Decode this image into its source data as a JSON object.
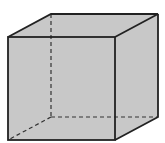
{
  "diagram": {
    "type": "cube-wireframe",
    "colors": {
      "fill": "#c8c8c8",
      "stroke": "#222222",
      "background": "#ffffff"
    },
    "vertices": {
      "front_top_left": [
        8,
        37
      ],
      "front_top_right": [
        115,
        37
      ],
      "front_bottom_left": [
        8,
        140
      ],
      "front_bottom_right": [
        115,
        140
      ],
      "back_top_left": [
        51,
        14
      ],
      "back_top_right": [
        158,
        14
      ],
      "back_bottom_right": [
        158,
        117
      ],
      "back_bottom_left": [
        51,
        117
      ]
    },
    "visible_edges": 9,
    "hidden_edges": 3
  }
}
